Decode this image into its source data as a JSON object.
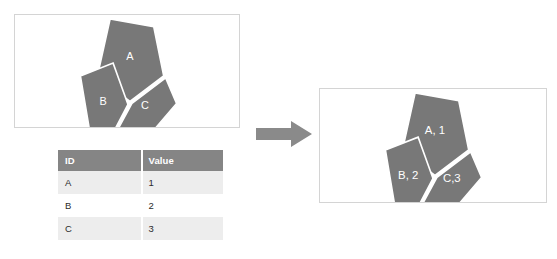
{
  "figure": {
    "left_panel": {
      "name": "geometry-panel",
      "polygons": [
        {
          "id": "A",
          "label": "A",
          "points": "96,4 140,12 150,62 116,88 83,63",
          "label_x": 116,
          "label_y": 43
        },
        {
          "id": "B",
          "label": "B",
          "points": "66,62 99,49 114,91 101,116 75,116",
          "label_x": 89,
          "label_y": 89
        },
        {
          "id": "C",
          "label": "C",
          "points": "152,64 163,90 141,116 104,116 118,90",
          "label_x": 131,
          "label_y": 93
        }
      ]
    },
    "right_panel": {
      "name": "joined-geometry-panel",
      "polygons": [
        {
          "id": "A",
          "label": "A, 1",
          "points": "96,4 140,12 150,62 116,88 83,63",
          "label_x": 116,
          "label_y": 43
        },
        {
          "id": "B",
          "label": "B, 2",
          "points": "66,62 99,49 114,91 101,116 75,116",
          "label_x": 89,
          "label_y": 89
        },
        {
          "id": "C",
          "label": "C,3",
          "points": "152,64 163,90 141,116 104,116 118,90",
          "label_x": 133,
          "label_y": 92
        }
      ]
    },
    "arrow": {
      "name": "transform-arrow",
      "direction": "right"
    },
    "table": {
      "name": "attribute-table",
      "columns": [
        "ID",
        "Value"
      ],
      "rows": [
        {
          "id": "A",
          "value": "1"
        },
        {
          "id": "B",
          "value": "2"
        },
        {
          "id": "C",
          "value": "3"
        }
      ]
    },
    "colors": {
      "polygon_fill": "#787878",
      "polygon_stroke": "#ffffff",
      "table_header_bg": "#858585",
      "table_header_text": "#ffffff",
      "table_alt_row_bg": "#ededed",
      "table_row_bg": "#ffffff",
      "table_text": "#2b2b2b",
      "arrow_fill": "#8a8a8a",
      "panel_border": "#d4d4d4",
      "background": "#ffffff"
    }
  }
}
